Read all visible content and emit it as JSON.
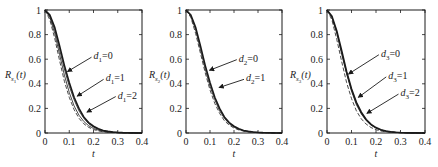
{
  "figure": {
    "width": 438,
    "height": 167,
    "line_color": "#1a1a1a",
    "background": "#ffffff"
  },
  "chart_data": [
    {
      "type": "line",
      "title": "",
      "xlabel": "t",
      "ylabel": "R_{s1}(t)",
      "ylabel_main": "R",
      "ylabel_sub": "s",
      "ylabel_subsub": "1",
      "ylabel_arg": "(t)",
      "xlim": [
        0,
        0.4
      ],
      "ylim": [
        0,
        1
      ],
      "xticks": [
        0,
        0.1,
        0.2,
        0.3,
        0.4
      ],
      "xtick_labels": [
        "0",
        "0.1",
        "0.2",
        "0.3",
        "0.4"
      ],
      "yticks": [
        0,
        0.2,
        0.4,
        0.6,
        0.8,
        1
      ],
      "ytick_labels": [
        "0",
        "0.2",
        "0.4",
        "0.6",
        "0.8",
        "1"
      ],
      "grid": false,
      "x": [
        0,
        0.02,
        0.04,
        0.06,
        0.08,
        0.1,
        0.12,
        0.14,
        0.16,
        0.18,
        0.2,
        0.22,
        0.24,
        0.26,
        0.28,
        0.3,
        0.32,
        0.34,
        0.36,
        0.38,
        0.4
      ],
      "series": [
        {
          "name": "d1=0",
          "style": "solid-thick",
          "values": [
            1,
            0.96,
            0.86,
            0.71,
            0.55,
            0.41,
            0.29,
            0.2,
            0.13,
            0.085,
            0.055,
            0.035,
            0.021,
            0.013,
            0.008,
            0.005,
            0.003,
            0.002,
            0.001,
            0.0005,
            0.0002
          ]
        },
        {
          "name": "d1=1",
          "style": "solid",
          "values": [
            1,
            0.95,
            0.84,
            0.68,
            0.52,
            0.38,
            0.27,
            0.18,
            0.12,
            0.075,
            0.048,
            0.03,
            0.018,
            0.011,
            0.007,
            0.004,
            0.0025,
            0.0015,
            0.001,
            0.0005,
            0.0002
          ]
        },
        {
          "name": "d1=2",
          "style": "solid",
          "values": [
            1,
            0.94,
            0.81,
            0.64,
            0.47,
            0.33,
            0.22,
            0.145,
            0.094,
            0.059,
            0.037,
            0.023,
            0.014,
            0.008,
            0.005,
            0.003,
            0.0018,
            0.001,
            0.0006,
            0.0003,
            0.0001
          ]
        },
        {
          "name": "reference",
          "style": "dashed",
          "values": [
            1,
            0.92,
            0.77,
            0.59,
            0.42,
            0.29,
            0.19,
            0.12,
            0.075,
            0.046,
            0.028,
            0.017,
            0.01,
            0.006,
            0.0035,
            0.002,
            0.0012,
            0.0007,
            0.0004,
            0.0002,
            0.0001
          ]
        }
      ],
      "annotations": [
        {
          "text_main": "d",
          "text_sub": "1",
          "text_rest": "=0",
          "label_x": 0.2,
          "label_y": 0.6,
          "arrow_to_x": 0.085,
          "arrow_to_y": 0.5
        },
        {
          "text_main": "d",
          "text_sub": "1",
          "text_rest": "=1",
          "label_x": 0.25,
          "label_y": 0.42,
          "arrow_to_x": 0.125,
          "arrow_to_y": 0.3
        },
        {
          "text_main": "d",
          "text_sub": "1",
          "text_rest": "=2",
          "label_x": 0.3,
          "label_y": 0.28,
          "arrow_to_x": 0.165,
          "arrow_to_y": 0.17
        }
      ]
    },
    {
      "type": "line",
      "title": "",
      "xlabel": "t",
      "ylabel": "R_{s2}(t)",
      "ylabel_main": "R",
      "ylabel_sub": "s",
      "ylabel_subsub": "2",
      "ylabel_arg": "(t)",
      "xlim": [
        0,
        0.4
      ],
      "ylim": [
        0,
        1
      ],
      "xticks": [
        0,
        0.1,
        0.2,
        0.3,
        0.4
      ],
      "xtick_labels": [
        "0",
        "0.1",
        "0.2",
        "0.3",
        "0.4"
      ],
      "yticks": [
        0,
        0.2,
        0.4,
        0.6,
        0.8,
        1
      ],
      "ytick_labels": [
        "0",
        "0.2",
        "0.4",
        "0.6",
        "0.8",
        "1"
      ],
      "grid": false,
      "x": [
        0,
        0.02,
        0.04,
        0.06,
        0.08,
        0.1,
        0.12,
        0.14,
        0.16,
        0.18,
        0.2,
        0.22,
        0.24,
        0.26,
        0.28,
        0.3,
        0.32,
        0.34,
        0.36,
        0.38,
        0.4
      ],
      "series": [
        {
          "name": "d2=0",
          "style": "solid-thick",
          "values": [
            1,
            0.96,
            0.86,
            0.71,
            0.55,
            0.41,
            0.29,
            0.2,
            0.13,
            0.085,
            0.055,
            0.035,
            0.021,
            0.013,
            0.008,
            0.005,
            0.003,
            0.002,
            0.001,
            0.0005,
            0.0002
          ]
        },
        {
          "name": "d2=1",
          "style": "solid",
          "values": [
            1,
            0.95,
            0.84,
            0.68,
            0.52,
            0.38,
            0.27,
            0.18,
            0.12,
            0.075,
            0.048,
            0.03,
            0.018,
            0.011,
            0.007,
            0.004,
            0.0025,
            0.0015,
            0.001,
            0.0005,
            0.0002
          ]
        },
        {
          "name": "reference",
          "style": "dashed",
          "values": [
            1,
            0.94,
            0.81,
            0.65,
            0.49,
            0.35,
            0.24,
            0.16,
            0.1,
            0.064,
            0.04,
            0.025,
            0.015,
            0.009,
            0.0055,
            0.0033,
            0.002,
            0.0012,
            0.0007,
            0.0004,
            0.0002
          ]
        }
      ],
      "annotations": [
        {
          "text_main": "d",
          "text_sub": "2",
          "text_rest": "=0",
          "label_x": 0.22,
          "label_y": 0.58,
          "arrow_to_x": 0.09,
          "arrow_to_y": 0.51
        },
        {
          "text_main": "d",
          "text_sub": "2",
          "text_rest": "=1",
          "label_x": 0.25,
          "label_y": 0.42,
          "arrow_to_x": 0.13,
          "arrow_to_y": 0.37
        }
      ]
    },
    {
      "type": "line",
      "title": "",
      "xlabel": "t",
      "ylabel": "R_{s3}(t)",
      "ylabel_main": "R",
      "ylabel_sub": "s",
      "ylabel_subsub": "3",
      "ylabel_arg": "(t)",
      "xlim": [
        0,
        0.4
      ],
      "ylim": [
        0,
        1
      ],
      "xticks": [
        0,
        0.1,
        0.2,
        0.3,
        0.4
      ],
      "xtick_labels": [
        "0",
        "0.1",
        "0.2",
        "0.3",
        "0.4"
      ],
      "yticks": [
        0,
        0.2,
        0.4,
        0.6,
        0.8,
        1
      ],
      "ytick_labels": [
        "0",
        "0.2",
        "0.4",
        "0.6",
        "0.8",
        "1"
      ],
      "grid": false,
      "x": [
        0,
        0.02,
        0.04,
        0.06,
        0.08,
        0.1,
        0.12,
        0.14,
        0.16,
        0.18,
        0.2,
        0.22,
        0.24,
        0.26,
        0.28,
        0.3,
        0.32,
        0.34,
        0.36,
        0.38,
        0.4
      ],
      "series": [
        {
          "name": "d3=0",
          "style": "solid-thick",
          "values": [
            1,
            0.95,
            0.83,
            0.67,
            0.5,
            0.36,
            0.25,
            0.17,
            0.11,
            0.07,
            0.044,
            0.027,
            0.016,
            0.01,
            0.006,
            0.0035,
            0.002,
            0.0012,
            0.0007,
            0.0004,
            0.0002
          ]
        },
        {
          "name": "d3=1",
          "style": "solid",
          "values": [
            1,
            0.945,
            0.82,
            0.655,
            0.49,
            0.35,
            0.24,
            0.16,
            0.105,
            0.066,
            0.041,
            0.025,
            0.015,
            0.009,
            0.0055,
            0.0032,
            0.0019,
            0.0011,
            0.0006,
            0.0003,
            0.0002
          ]
        },
        {
          "name": "d3=2",
          "style": "solid",
          "values": [
            1,
            0.94,
            0.81,
            0.64,
            0.48,
            0.34,
            0.23,
            0.155,
            0.1,
            0.063,
            0.039,
            0.024,
            0.014,
            0.0085,
            0.005,
            0.003,
            0.0018,
            0.001,
            0.0006,
            0.0003,
            0.0001
          ]
        },
        {
          "name": "reference",
          "style": "dashed",
          "values": [
            1,
            0.92,
            0.76,
            0.58,
            0.41,
            0.28,
            0.18,
            0.115,
            0.072,
            0.044,
            0.027,
            0.016,
            0.0095,
            0.0055,
            0.0032,
            0.0018,
            0.001,
            0.0006,
            0.0003,
            0.0002,
            0.0001
          ]
        }
      ],
      "annotations": [
        {
          "text_main": "d",
          "text_sub": "3",
          "text_rest": "=0",
          "label_x": 0.22,
          "label_y": 0.62,
          "arrow_to_x": 0.08,
          "arrow_to_y": 0.48
        },
        {
          "text_main": "d",
          "text_sub": "3",
          "text_rest": "=1",
          "label_x": 0.25,
          "label_y": 0.44,
          "arrow_to_x": 0.12,
          "arrow_to_y": 0.29
        },
        {
          "text_main": "d",
          "text_sub": "3",
          "text_rest": "=2",
          "label_x": 0.3,
          "label_y": 0.3,
          "arrow_to_x": 0.155,
          "arrow_to_y": 0.16
        }
      ]
    }
  ]
}
